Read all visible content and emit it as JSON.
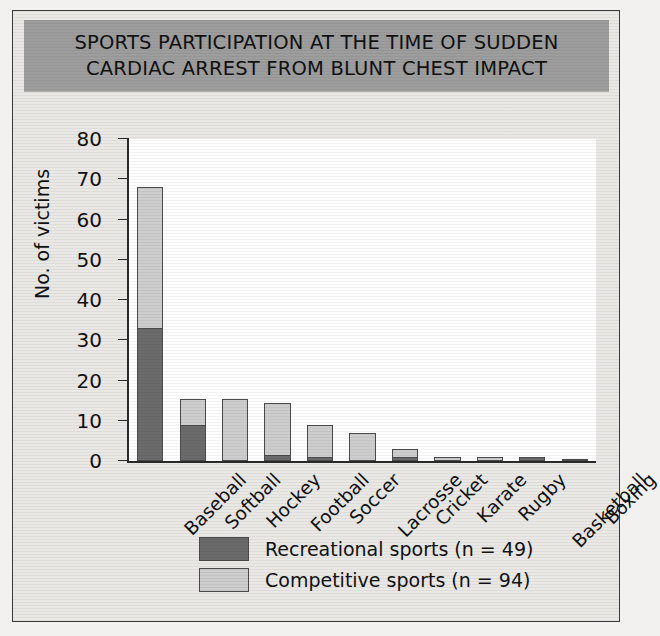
{
  "figure": {
    "title": "SPORTS PARTICIPATION AT THE TIME OF SUDDEN CARDIAC ARREST FROM BLUNT CHEST IMPACT",
    "banner_color": "#9d9d9d",
    "background_color": "#e9e8e5"
  },
  "chart_data": {
    "type": "bar",
    "subtype": "stacked-vertical",
    "title": "SPORTS PARTICIPATION AT THE TIME OF SUDDEN CARDIAC ARREST FROM BLUNT CHEST IMPACT",
    "xlabel": "",
    "ylabel": "No. of victims",
    "ylim": [
      0,
      80
    ],
    "ytick_values": [
      0,
      10,
      20,
      30,
      40,
      50,
      60,
      70,
      80
    ],
    "ytick_labels": [
      "0",
      "10",
      "20",
      "30",
      "40",
      "50",
      "60",
      "70",
      "80"
    ],
    "grid": false,
    "legend_position": "bottom-center",
    "categories": [
      "Baseball",
      "Softball",
      "Hockey",
      "Football",
      "Soccer",
      "Lacrosse",
      "Cricket",
      "Karate",
      "Rugby",
      "Basketball",
      "Boxing"
    ],
    "series": [
      {
        "name": "Recreational sports (n = 49)",
        "color": "#6b6b6b",
        "values": [
          33,
          9,
          0,
          1.5,
          1,
          0,
          1,
          0,
          0,
          1,
          0.5
        ]
      },
      {
        "name": "Competitive sports (n = 94)",
        "color": "#cdcdcd",
        "values": [
          35,
          6.5,
          15.5,
          13,
          8,
          7,
          2,
          1,
          1,
          0,
          0
        ]
      }
    ],
    "totals": [
      68,
      15.5,
      15.5,
      14.5,
      9,
      7,
      3,
      1,
      1,
      1,
      0.5
    ]
  },
  "legend": {
    "items": [
      {
        "label": "Recreational sports (n = 49)",
        "color": "#6b6b6b"
      },
      {
        "label": "Competitive sports (n = 94)",
        "color": "#cdcdcd"
      }
    ]
  }
}
